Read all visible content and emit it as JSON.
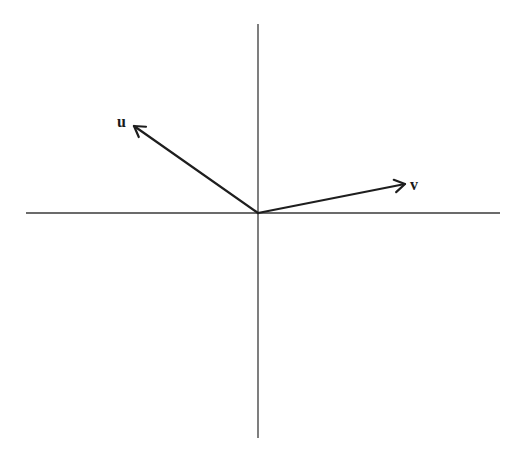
{
  "diagram": {
    "title": "",
    "origin": [
      258,
      213
    ],
    "axes": {
      "horizontal": {
        "x1": 26,
        "x2": 500,
        "y": 213
      },
      "vertical": {
        "x": 258,
        "y1": 24,
        "y2": 438
      }
    },
    "vectors": [
      {
        "name": "u",
        "label": "u",
        "tip": [
          134,
          126
        ],
        "label_pos": [
          117,
          127
        ]
      },
      {
        "name": "v",
        "label": "v",
        "tip": [
          405,
          184
        ],
        "label_pos": [
          410,
          190
        ]
      }
    ],
    "colors": {
      "axis": "#3a3a3a",
      "vector": "#1e1e1e",
      "background": "#ffffff"
    }
  }
}
